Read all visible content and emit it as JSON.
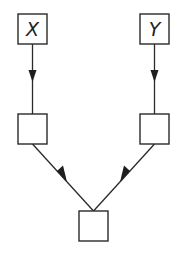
{
  "diagram": {
    "type": "directed-graph",
    "nodes": [
      {
        "id": "x",
        "label": "X",
        "x": 18,
        "y": 14,
        "w": 29,
        "h": 30
      },
      {
        "id": "y",
        "label": "Y",
        "x": 140,
        "y": 14,
        "w": 29,
        "h": 30
      },
      {
        "id": "mid_left",
        "label": "",
        "x": 18,
        "y": 114,
        "w": 29,
        "h": 30
      },
      {
        "id": "mid_right",
        "label": "",
        "x": 140,
        "y": 114,
        "w": 29,
        "h": 30
      },
      {
        "id": "bottom",
        "label": "",
        "x": 79,
        "y": 211,
        "w": 29,
        "h": 30
      }
    ],
    "edges": [
      {
        "from": "x",
        "to": "mid_left"
      },
      {
        "from": "y",
        "to": "mid_right"
      },
      {
        "from": "mid_left",
        "to": "bottom"
      },
      {
        "from": "mid_right",
        "to": "bottom"
      }
    ],
    "colors": {
      "stroke": "#2a2a2a",
      "background": "#ffffff"
    }
  }
}
